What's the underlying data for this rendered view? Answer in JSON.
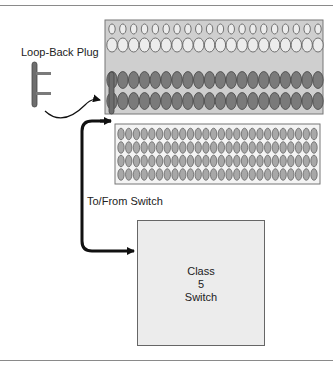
{
  "labels": {
    "loopback_plug": "Loop-Back Plug",
    "to_from_switch": "To/From Switch"
  },
  "switch_box": {
    "line1": "Class",
    "line2": "5",
    "line3": "Switch"
  },
  "upper_panel": {
    "rows": [
      {
        "type": "small-light",
        "count": 20
      },
      {
        "type": "large-light",
        "count": 20
      },
      {
        "type": "dark",
        "count": 20
      },
      {
        "type": "dark",
        "count": 20
      }
    ]
  },
  "lower_panel": {
    "rows": 4,
    "columns": 26
  },
  "colors": {
    "panel_fill": "#cfcfcf",
    "panel_border": "#777777",
    "light_jack": "#ececec",
    "dark_jack": "#7a7a7a",
    "lower_jack": "#a8a8a8",
    "plug": "#6e6e6e",
    "arrow": "#111111"
  }
}
